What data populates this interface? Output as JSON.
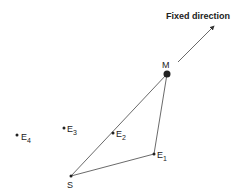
{
  "diagram": {
    "direction_label": "Fixed direction",
    "points": {
      "M": {
        "label": "M",
        "x": 167,
        "y": 74
      },
      "S": {
        "label": "S",
        "x": 71,
        "y": 176
      },
      "E1": {
        "label": "E",
        "sub": "1",
        "x": 154,
        "y": 154
      },
      "E2": {
        "label": "E",
        "sub": "2",
        "x": 113,
        "y": 133
      },
      "E3": {
        "label": "E",
        "sub": "3",
        "x": 64,
        "y": 128
      },
      "E4": {
        "label": "E",
        "sub": "4",
        "x": 17,
        "y": 135
      }
    },
    "colors": {
      "line": "#444444",
      "dot": "#222222",
      "text": "#222222"
    }
  }
}
